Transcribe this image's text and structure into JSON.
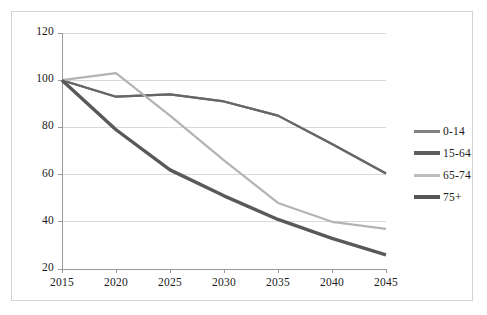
{
  "chart_data": {
    "type": "line",
    "title": "",
    "subtitle": "",
    "xlabel": "",
    "ylabel": "",
    "x": [
      2015,
      2020,
      2025,
      2030,
      2035,
      2040,
      2045
    ],
    "xtick_labels": [
      "2015",
      "2020",
      "2025",
      "2030",
      "2035",
      "2040",
      "2045"
    ],
    "ytick_labels": [
      "20",
      "40",
      "60",
      "80",
      "100",
      "120"
    ],
    "ytick_values": [
      20,
      40,
      60,
      80,
      100,
      120
    ],
    "ylim": [
      20,
      120
    ],
    "xlim": [
      2015,
      2045
    ],
    "grid": "horizontal",
    "legend_position": "right",
    "series": [
      {
        "name": "0-14",
        "color": "#808080",
        "width": 2.2,
        "values": [
          100,
          93,
          94,
          91,
          85,
          73,
          60.5
        ]
      },
      {
        "name": "15-64",
        "color": "#666666",
        "width": 2.2,
        "values": [
          100,
          93,
          94,
          91,
          85,
          73,
          60.5
        ]
      },
      {
        "name": "65-74",
        "color": "#b3b3b3",
        "width": 2.2,
        "values": [
          100,
          103,
          85,
          66,
          48,
          40,
          37
        ]
      },
      {
        "name": "75+",
        "color": "#595959",
        "width": 3.4,
        "values": [
          100,
          79,
          62,
          51,
          41,
          33,
          26
        ]
      }
    ]
  },
  "legend": {
    "entries": [
      {
        "label": "0-14",
        "color": "#808080",
        "width": 3
      },
      {
        "label": "15-64",
        "color": "#5e5e5e",
        "width": 3.4
      },
      {
        "label": "65-74",
        "color": "#bdbdbd",
        "width": 3
      },
      {
        "label": "75+",
        "color": "#555555",
        "width": 3.4
      }
    ]
  },
  "axes": {
    "grid_color": "#d9d9d9",
    "axis_color": "#9a9a9a",
    "border_color": "#d2d2d2",
    "text_color": "#1a1a1a",
    "background": "#ffffff"
  }
}
